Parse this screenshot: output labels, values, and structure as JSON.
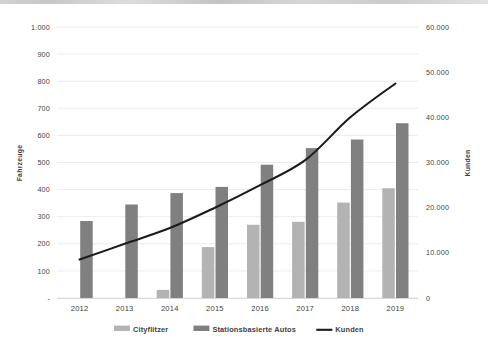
{
  "chart_data": {
    "type": "bar",
    "title": "",
    "subtitle": "",
    "xlabel": "",
    "ylabel": "Fahrzeuge",
    "y2label": "Kunden",
    "categories": [
      "2012",
      "2013",
      "2014",
      "2015",
      "2016",
      "2017",
      "2018",
      "2019"
    ],
    "series": [
      {
        "name": "Cityflitzer",
        "type": "bar",
        "axis": "left",
        "color": "#b3b3b3",
        "values": [
          0,
          0,
          30,
          188,
          270,
          281,
          352,
          405
        ]
      },
      {
        "name": "Stationsbasierte Autos",
        "type": "bar",
        "axis": "left",
        "color": "#808080",
        "values": [
          284,
          345,
          387,
          410,
          492,
          553,
          585,
          645
        ]
      },
      {
        "name": "Kunden",
        "type": "line",
        "axis": "right",
        "color": "#1b1b1b",
        "values": [
          8500,
          12000,
          15500,
          20000,
          25000,
          30500,
          40000,
          47500
        ]
      }
    ],
    "ylim": [
      0,
      1000
    ],
    "y2lim": [
      0,
      60000
    ],
    "ytick_labels": [
      "-",
      "100",
      "200",
      "300",
      "400",
      "500",
      "600",
      "700",
      "800",
      "900",
      "1.000"
    ],
    "ytick_values": [
      0,
      100,
      200,
      300,
      400,
      500,
      600,
      700,
      800,
      900,
      1000
    ],
    "y2tick_labels": [
      "0",
      "10.000",
      "20.000",
      "30.000",
      "40.000",
      "50.000",
      "60.000"
    ],
    "y2tick_values": [
      0,
      10000,
      20000,
      30000,
      40000,
      50000,
      60000
    ],
    "grid": true,
    "legend_position": "bottom"
  },
  "legend": {
    "items": [
      {
        "label": "Cityflitzer",
        "marker": "swatch",
        "color": "#b3b3b3"
      },
      {
        "label": "Stationsbasierte Autos",
        "marker": "swatch",
        "color": "#808080"
      },
      {
        "label": "Kunden",
        "marker": "line",
        "color": "#1b1b1b"
      }
    ]
  }
}
